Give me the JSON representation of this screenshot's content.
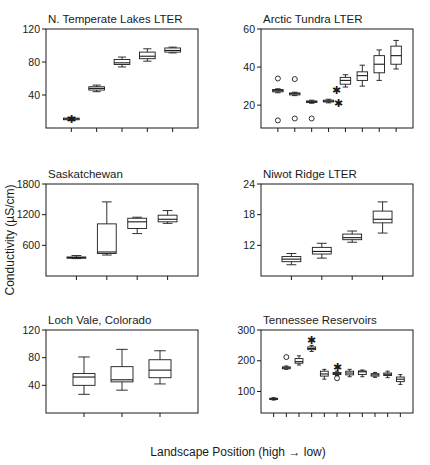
{
  "figure": {
    "y_axis_label": "Conductivity (µS/cm)",
    "x_axis_label": "Landscape Position (high → low)",
    "x_axis_label_prefix": "Landscape Position (high",
    "x_axis_label_suffix": "low)",
    "arrow_glyph": "→",
    "stroke_color": "#1a1a1a",
    "fill_color": "#ffffff"
  },
  "chart_data": [
    {
      "type": "box",
      "panel": 0,
      "title": "N. Temperate Lakes LTER",
      "xlabel": "",
      "ylabel": "Conductivity (µS/cm)",
      "ylim": [
        0,
        120
      ],
      "yticks": [
        40,
        80,
        120
      ],
      "ytick_labels": [
        "40",
        "80",
        "120"
      ],
      "grid": false,
      "n_positions": 5,
      "categories": [
        "1",
        "2",
        "3",
        "4",
        "5"
      ],
      "boxes": [
        {
          "pos": 1,
          "whisker_low": 9,
          "q1": 10,
          "median": 11,
          "q3": 12,
          "whisker_high": 13,
          "marker": "asterisk",
          "marker_y": 11,
          "outliers": []
        },
        {
          "pos": 2,
          "whisker_low": 44,
          "q1": 46,
          "median": 48,
          "q3": 50,
          "whisker_high": 52,
          "marker": "none",
          "outliers": []
        },
        {
          "pos": 3,
          "whisker_low": 74,
          "q1": 77,
          "median": 79,
          "q3": 83,
          "whisker_high": 86,
          "marker": "none",
          "outliers": []
        },
        {
          "pos": 4,
          "whisker_low": 81,
          "q1": 84,
          "median": 87,
          "q3": 92,
          "whisker_high": 96,
          "marker": "none",
          "outliers": []
        },
        {
          "pos": 5,
          "whisker_low": 91,
          "q1": 92,
          "median": 94,
          "q3": 97,
          "whisker_high": 98,
          "marker": "none",
          "outliers": []
        }
      ]
    },
    {
      "type": "box",
      "panel": 1,
      "title": "Arctic Tundra LTER",
      "xlabel": "",
      "ylabel": "Conductivity (µS/cm)",
      "ylim": [
        8,
        60
      ],
      "yticks": [
        20,
        40,
        60
      ],
      "ytick_labels": [
        "20",
        "40",
        "60"
      ],
      "grid": false,
      "n_positions": 8,
      "categories": [
        "1",
        "2",
        "3",
        "4",
        "5",
        "6",
        "7",
        "8"
      ],
      "boxes": [
        {
          "pos": 1,
          "whisker_low": 26.5,
          "q1": 27,
          "median": 27.6,
          "q3": 28.2,
          "whisker_high": 28.6,
          "marker": "none",
          "outliers": [
            34,
            12
          ]
        },
        {
          "pos": 2,
          "whisker_low": 25,
          "q1": 25.4,
          "median": 26,
          "q3": 26.4,
          "whisker_high": 26.8,
          "marker": "none",
          "outliers": [
            33.7,
            13
          ]
        },
        {
          "pos": 3,
          "whisker_low": 21,
          "q1": 21.4,
          "median": 21.8,
          "q3": 22.2,
          "whisker_high": 22.6,
          "marker": "none",
          "outliers": [
            13
          ]
        },
        {
          "pos": 4,
          "whisker_low": 21.2,
          "q1": 21.7,
          "median": 22.1,
          "q3": 22.6,
          "whisker_high": 23.1,
          "marker": "none",
          "outliers": []
        },
        {
          "pos": 5,
          "whisker_low": 29.5,
          "q1": 31,
          "median": 33,
          "q3": 34.6,
          "whisker_high": 36,
          "marker": "asterisk_pair",
          "marker_y_high": 28,
          "marker_y_low": 21,
          "outliers": []
        },
        {
          "pos": 6,
          "whisker_low": 30,
          "q1": 33,
          "median": 35.5,
          "q3": 37.5,
          "whisker_high": 41,
          "marker": "none",
          "outliers": []
        },
        {
          "pos": 7,
          "whisker_low": 33,
          "q1": 37,
          "median": 41.5,
          "q3": 46,
          "whisker_high": 49,
          "marker": "none",
          "outliers": []
        },
        {
          "pos": 8,
          "whisker_low": 39,
          "q1": 41.5,
          "median": 46,
          "q3": 51,
          "whisker_high": 54,
          "marker": "none",
          "outliers": []
        }
      ]
    },
    {
      "type": "box",
      "panel": 2,
      "title": "Saskatchewan",
      "xlabel": "",
      "ylabel": "Conductivity (µS/cm)",
      "ylim": [
        0,
        1800
      ],
      "yticks": [
        600,
        1200,
        1800
      ],
      "ytick_labels": [
        "600",
        "1200",
        "1800"
      ],
      "grid": false,
      "n_positions": 4,
      "categories": [
        "1",
        "2",
        "3",
        "4"
      ],
      "boxes": [
        {
          "pos": 1,
          "whisker_low": 340,
          "q1": 350,
          "median": 360,
          "q3": 372,
          "whisker_high": 400,
          "marker": "none",
          "outliers": []
        },
        {
          "pos": 2,
          "whisker_low": 410,
          "q1": 440,
          "median": 470,
          "q3": 1020,
          "whisker_high": 1450,
          "marker": "none",
          "outliers": []
        },
        {
          "pos": 3,
          "whisker_low": 830,
          "q1": 930,
          "median": 1060,
          "q3": 1130,
          "whisker_high": 1150,
          "marker": "none",
          "outliers": []
        },
        {
          "pos": 4,
          "whisker_low": 1030,
          "q1": 1060,
          "median": 1110,
          "q3": 1190,
          "whisker_high": 1280,
          "marker": "none",
          "outliers": []
        }
      ]
    },
    {
      "type": "box",
      "panel": 3,
      "title": "Niwot Ridge LTER",
      "xlabel": "",
      "ylabel": "Conductivity (µS/cm)",
      "ylim": [
        6,
        24
      ],
      "yticks": [
        12,
        18,
        24
      ],
      "ytick_labels": [
        "12",
        "18",
        "24"
      ],
      "grid": false,
      "n_positions": 4,
      "categories": [
        "1",
        "2",
        "3",
        "4"
      ],
      "boxes": [
        {
          "pos": 1,
          "whisker_low": 8.2,
          "q1": 8.8,
          "median": 9.3,
          "q3": 9.8,
          "whisker_high": 10.4,
          "marker": "none",
          "outliers": []
        },
        {
          "pos": 2,
          "whisker_low": 9.5,
          "q1": 10.3,
          "median": 10.8,
          "q3": 11.6,
          "whisker_high": 12.4,
          "marker": "none",
          "outliers": []
        },
        {
          "pos": 3,
          "whisker_low": 12.6,
          "q1": 13.1,
          "median": 13.5,
          "q3": 14.2,
          "whisker_high": 14.8,
          "marker": "none",
          "outliers": []
        },
        {
          "pos": 4,
          "whisker_low": 14.4,
          "q1": 16.4,
          "median": 17.1,
          "q3": 18.7,
          "whisker_high": 20.5,
          "marker": "none",
          "outliers": []
        }
      ]
    },
    {
      "type": "box",
      "panel": 4,
      "title": "Loch Vale, Colorado",
      "xlabel": "",
      "ylabel": "Conductivity (µS/cm)",
      "ylim": [
        0,
        120
      ],
      "yticks": [
        40,
        80,
        120
      ],
      "ytick_labels": [
        "40",
        "80",
        "120"
      ],
      "grid": false,
      "n_positions": 3,
      "categories": [
        "1",
        "2",
        "3"
      ],
      "boxes": [
        {
          "pos": 1,
          "whisker_low": 27,
          "q1": 40,
          "median": 52,
          "q3": 57,
          "whisker_high": 81,
          "marker": "none",
          "outliers": []
        },
        {
          "pos": 2,
          "whisker_low": 33,
          "q1": 45,
          "median": 48,
          "q3": 67,
          "whisker_high": 92,
          "marker": "none",
          "outliers": []
        },
        {
          "pos": 3,
          "whisker_low": 42,
          "q1": 51,
          "median": 62,
          "q3": 77,
          "whisker_high": 90,
          "marker": "none",
          "outliers": []
        }
      ]
    },
    {
      "type": "box",
      "panel": 5,
      "title": "Tennessee Reservoirs",
      "xlabel": "Landscape Position (high → low)",
      "ylabel": "Conductivity (µS/cm)",
      "ylim": [
        30,
        300
      ],
      "yticks": [
        100,
        200,
        300
      ],
      "ytick_labels": [
        "100",
        "200",
        "300"
      ],
      "grid": false,
      "n_positions": 11,
      "categories": [
        "1",
        "2",
        "3",
        "4",
        "5",
        "6",
        "7",
        "8",
        "9",
        "10",
        "11"
      ],
      "boxes": [
        {
          "pos": 1,
          "whisker_low": 72,
          "q1": 74,
          "median": 76,
          "q3": 78,
          "whisker_high": 80,
          "marker": "none",
          "outliers": []
        },
        {
          "pos": 2,
          "whisker_low": 172,
          "q1": 174,
          "median": 177,
          "q3": 180,
          "whisker_high": 183,
          "marker": "none",
          "outliers": [
            212
          ]
        },
        {
          "pos": 3,
          "whisker_low": 186,
          "q1": 192,
          "median": 197,
          "q3": 207,
          "whisker_high": 216,
          "marker": "none",
          "outliers": []
        },
        {
          "pos": 4,
          "whisker_low": 230,
          "q1": 236,
          "median": 240,
          "q3": 245,
          "whisker_high": 250,
          "marker": "asterisk",
          "marker_y": 266,
          "outliers": []
        },
        {
          "pos": 5,
          "whisker_low": 140,
          "q1": 150,
          "median": 157,
          "q3": 166,
          "whisker_high": 172,
          "marker": "none",
          "outliers": []
        },
        {
          "pos": 6,
          "whisker_low": 152,
          "q1": 155,
          "median": 158,
          "q3": 162,
          "whisker_high": 166,
          "marker": "asterisk",
          "marker_y": 180,
          "outliers": [
            143
          ]
        },
        {
          "pos": 7,
          "whisker_low": 148,
          "q1": 154,
          "median": 160,
          "q3": 166,
          "whisker_high": 172,
          "marker": "none",
          "outliers": []
        },
        {
          "pos": 8,
          "whisker_low": 148,
          "q1": 155,
          "median": 164,
          "q3": 167,
          "whisker_high": 170,
          "marker": "none",
          "outliers": []
        },
        {
          "pos": 9,
          "whisker_low": 146,
          "q1": 150,
          "median": 154,
          "q3": 158,
          "whisker_high": 162,
          "marker": "none",
          "outliers": []
        },
        {
          "pos": 10,
          "whisker_low": 145,
          "q1": 152,
          "median": 156,
          "q3": 160,
          "whisker_high": 166,
          "marker": "none",
          "outliers": []
        },
        {
          "pos": 11,
          "whisker_low": 123,
          "q1": 132,
          "median": 140,
          "q3": 147,
          "whisker_high": 155,
          "marker": "none",
          "outliers": []
        }
      ]
    }
  ]
}
